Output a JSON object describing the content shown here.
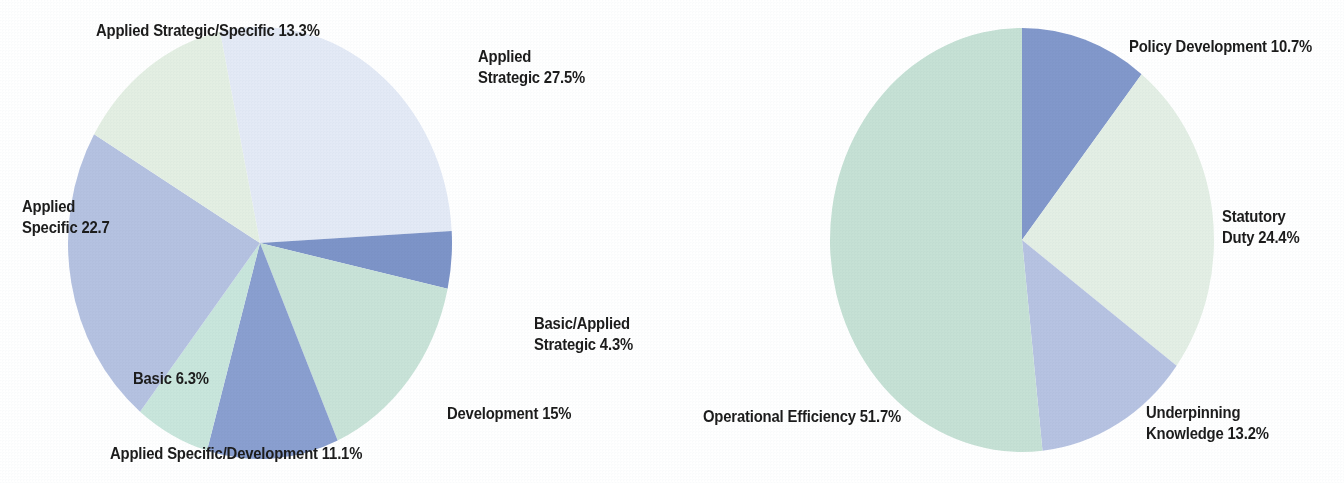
{
  "figure": {
    "background_color": "#ffffff",
    "label_color": "#1c1c1c"
  },
  "chart_data": [
    {
      "type": "pie",
      "name": "research-type-breakdown",
      "title": "",
      "legend_position": "outside-labels",
      "center": {
        "x": 260,
        "y": 243
      },
      "radius": {
        "rx": 192,
        "ry": 216
      },
      "start_angle_deg": -12,
      "direction": "clockwise",
      "categories": [
        "Applied Strategic",
        "Basic/Applied Strategic",
        "Development",
        "Applied Specific/Development",
        "Basic",
        "Applied Specific",
        "Applied Strategic/Specific"
      ],
      "values": [
        27.5,
        4.3,
        15,
        11.1,
        6.3,
        22.7,
        13.3
      ],
      "value_suffix": "%",
      "colors": [
        "#e4eaf6",
        "#7d94c8",
        "#c9e3d8",
        "#8a9fd0",
        "#c9e6dc",
        "#b5c2e1",
        "#e4efe3"
      ],
      "labels": [
        {
          "text": "Applied\nStrategic 27.5%",
          "align": "left",
          "x": 478,
          "y": 46
        },
        {
          "text": "Basic/Applied\nStrategic 4.3%",
          "align": "left",
          "x": 534,
          "y": 313
        },
        {
          "text": "Development 15%",
          "align": "left",
          "x": 447,
          "y": 403
        },
        {
          "text": "Applied Specific/Development 11.1%",
          "align": "left",
          "x": 110,
          "y": 443
        },
        {
          "text": "Basic 6.3%",
          "align": "left",
          "x": 133,
          "y": 368
        },
        {
          "text": "Applied\nSpecific 22.7",
          "align": "left",
          "x": 22,
          "y": 196
        },
        {
          "text": "Applied Strategic/Specific 13.3%",
          "align": "left",
          "x": 96,
          "y": 20
        }
      ]
    },
    {
      "type": "pie",
      "name": "activity-driver-breakdown",
      "title": "",
      "legend_position": "outside-labels",
      "center": {
        "x": 1022,
        "y": 240
      },
      "radius": {
        "rx": 192,
        "ry": 212
      },
      "start_angle_deg": 0,
      "direction": "clockwise",
      "categories": [
        "Policy Development",
        "Statutory Duty",
        "Underpinning Knowledge",
        "Operational Efficiency"
      ],
      "values": [
        10.7,
        24.4,
        13.2,
        51.7
      ],
      "value_suffix": "%",
      "colors": [
        "#8298cb",
        "#e4efe5",
        "#b7c3e2",
        "#c6e1d5"
      ],
      "labels": [
        {
          "text": "Policy Development 10.7%",
          "align": "left",
          "x": 1129,
          "y": 36
        },
        {
          "text": "Statutory\nDuty 24.4%",
          "align": "left",
          "x": 1222,
          "y": 206
        },
        {
          "text": "Underpinning\nKnowledge 13.2%",
          "align": "left",
          "x": 1146,
          "y": 402
        },
        {
          "text": "Operational Efficiency 51.7%",
          "align": "left",
          "x": 703,
          "y": 406
        }
      ]
    }
  ]
}
